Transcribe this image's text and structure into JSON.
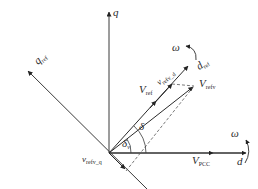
{
  "diagram": {
    "colors": {
      "axis": "#3a3a3a",
      "vector": "#2a2a2a",
      "dashed": "#555555",
      "background": "#ffffff"
    },
    "labels": {
      "q_axis": "q",
      "d_axis": "d",
      "q_ref": {
        "main": "q",
        "sub": "ref"
      },
      "d_ref": {
        "main": "d",
        "sub": "ref"
      },
      "omega_top": "ω",
      "omega_right": "ω",
      "v_ref": {
        "main": "V",
        "sub": "ref"
      },
      "v_refv_d": {
        "main": "v",
        "sub": "refv_d"
      },
      "v_refv": {
        "main": "V",
        "sub": "refv"
      },
      "v_refv_q": {
        "main": "v",
        "sub": "refv_q"
      },
      "v_pcc": {
        "main": "V",
        "sub": "PCC"
      },
      "delta": "δ",
      "delta_v": {
        "main": "δ",
        "sub": "v"
      }
    },
    "vectors": [
      {
        "name": "q-axis",
        "from": [
          109,
          153
        ],
        "to": [
          109,
          10
        ]
      },
      {
        "name": "d-axis",
        "from": [
          109,
          153
        ],
        "to": [
          245,
          153
        ]
      },
      {
        "name": "q_ref-axis",
        "from": [
          148,
          190
        ],
        "to": [
          27,
          70
        ]
      },
      {
        "name": "d_ref-axis",
        "from": [
          109,
          153
        ],
        "to": [
          190,
          65
        ]
      },
      {
        "name": "V_ref",
        "from": [
          109,
          153
        ],
        "to": [
          157,
          100
        ]
      },
      {
        "name": "V_refv",
        "from": [
          109,
          153
        ],
        "to": [
          194,
          86
        ]
      },
      {
        "name": "V_PCC",
        "from": [
          109,
          153
        ],
        "to": [
          213,
          153
        ]
      },
      {
        "name": "v_refv_q",
        "from": [
          109,
          153
        ],
        "to": [
          126,
          170
        ]
      }
    ]
  }
}
